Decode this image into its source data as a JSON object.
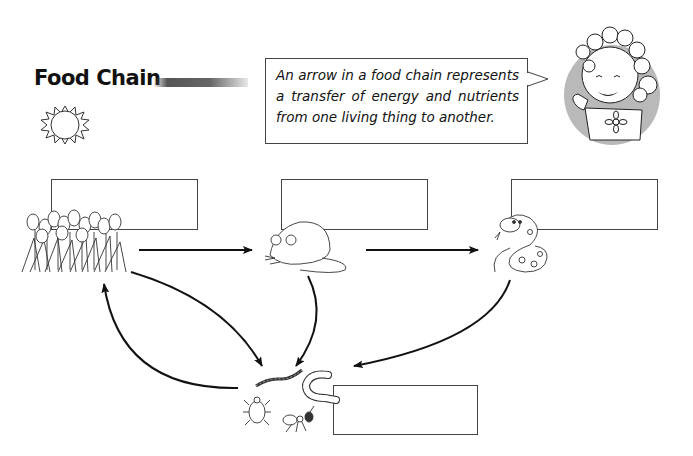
{
  "title": "Food Chain",
  "callout": {
    "text": "An arrow in a food chain represents a transfer of energy and nutrients from one living thing to another."
  },
  "organisms": [
    {
      "name": "flowers",
      "role": "producer",
      "label": ""
    },
    {
      "name": "mouse",
      "role": "primary consumer",
      "label": ""
    },
    {
      "name": "snake",
      "role": "secondary consumer",
      "label": ""
    },
    {
      "name": "decomposers",
      "role": "decomposers (worm, grub, beetle, ant)",
      "label": ""
    }
  ],
  "arrows": [
    {
      "from": "flowers",
      "to": "mouse"
    },
    {
      "from": "mouse",
      "to": "snake"
    },
    {
      "from": "flowers",
      "to": "decomposers"
    },
    {
      "from": "mouse",
      "to": "decomposers"
    },
    {
      "from": "snake",
      "to": "decomposers"
    },
    {
      "from": "decomposers",
      "to": "flowers"
    }
  ],
  "icons": [
    "sun-icon",
    "teacher-girl-icon",
    "tulips-icon",
    "mouse-icon",
    "snake-icon",
    "earthworm-icon",
    "grub-icon",
    "beetle-icon",
    "ant-icon"
  ]
}
